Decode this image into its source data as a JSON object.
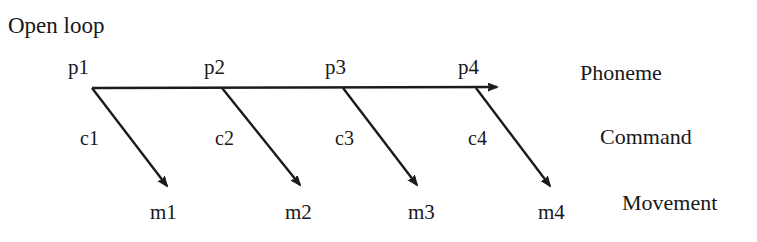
{
  "diagram": {
    "title": "Open loop",
    "tiers": [
      {
        "label": "Phoneme",
        "x": 580,
        "y": 62
      },
      {
        "label": "Command",
        "x": 600,
        "y": 126
      },
      {
        "label": "Movement",
        "x": 622,
        "y": 192
      }
    ],
    "phonemes": [
      {
        "label": "p1",
        "x": 68,
        "y": 57,
        "node_x": 92,
        "node_y": 88
      },
      {
        "label": "p2",
        "x": 204,
        "y": 57,
        "node_x": 222,
        "node_y": 88
      },
      {
        "label": "p3",
        "x": 325,
        "y": 57,
        "node_x": 343,
        "node_y": 88
      },
      {
        "label": "p4",
        "x": 458,
        "y": 57,
        "node_x": 476,
        "node_y": 88
      }
    ],
    "commands": [
      {
        "label": "c1",
        "x": 80,
        "y": 128
      },
      {
        "label": "c2",
        "x": 215,
        "y": 128
      },
      {
        "label": "c3",
        "x": 335,
        "y": 128
      },
      {
        "label": "c4",
        "x": 468,
        "y": 128
      }
    ],
    "movements": [
      {
        "label": "m1",
        "x": 150,
        "y": 202,
        "tip_x": 170,
        "tip_y": 190
      },
      {
        "label": "m2",
        "x": 285,
        "y": 202,
        "tip_x": 303,
        "tip_y": 189
      },
      {
        "label": "m3",
        "x": 408,
        "y": 202,
        "tip_x": 420,
        "tip_y": 189
      },
      {
        "label": "m4",
        "x": 538,
        "y": 202,
        "tip_x": 553,
        "tip_y": 190
      }
    ],
    "phoneme_axis": {
      "x1": 92,
      "y1": 88,
      "x2": 500,
      "y2": 87
    },
    "colors": {
      "stroke": "#1b1b1d",
      "text": "#18181a",
      "background": "#ffffff"
    },
    "stroke_width": 2.4
  }
}
